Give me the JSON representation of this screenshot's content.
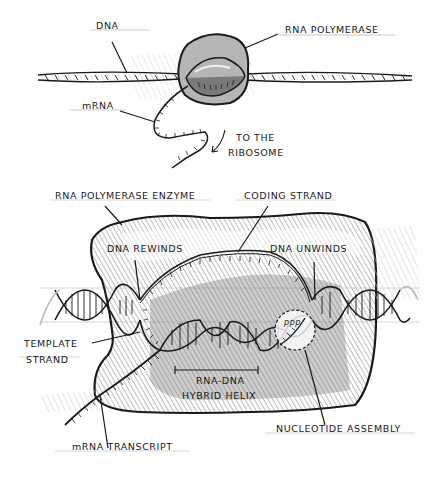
{
  "diagram": {
    "overview": {
      "labels": {
        "dna": "DNA",
        "rna_polymerase": "RNA POLYMERASE",
        "mrna": "mRNA",
        "to_ribosome_line1": "TO THE",
        "to_ribosome_line2": "RIBOSOME"
      }
    },
    "detail": {
      "labels": {
        "rna_polymerase_enzyme": "RNA POLYMERASE ENZYME",
        "coding_strand": "CODING STRAND",
        "dna_rewinds": "DNA REWINDS",
        "dna_unwinds": "DNA UNWINDS",
        "template_strand_line1": "TEMPLATE",
        "template_strand_line2": "STRAND",
        "hybrid_line1": "RNA-DNA",
        "hybrid_line2": "HYBRID HELIX",
        "mrna_transcript": "mRNA TRANSCRIPT",
        "nucleotide_assembly": "NUCLEOTIDE ASSEMBLY",
        "ppp": "ppp"
      }
    },
    "colors": {
      "ink": "#1a1a1a",
      "shade_dark": "#8a8a8a",
      "shade_light": "#cfcfcf",
      "background": "#ffffff"
    }
  }
}
